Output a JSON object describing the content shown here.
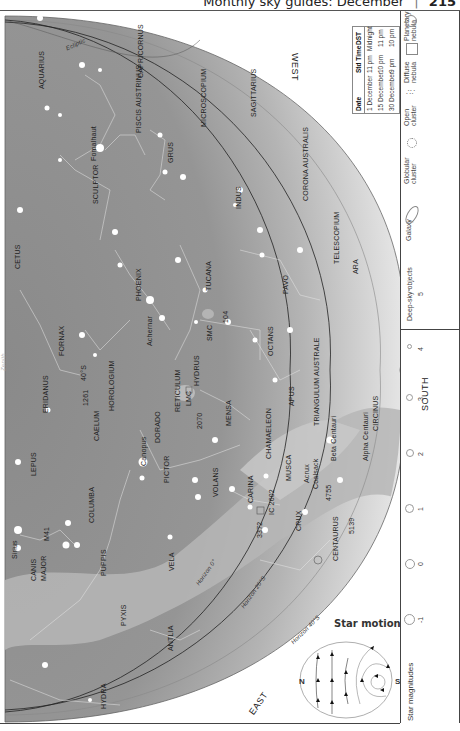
{
  "header": {
    "running_title": "Monthly sky guides: December",
    "separator": "|",
    "page_number": "215"
  },
  "chart": {
    "directions": {
      "west": "WEST",
      "south": "SOUTH",
      "east": "EAST"
    },
    "lines": {
      "ecliptic": "Ecliptic",
      "horizon_0": "Horizon 0°",
      "horizon_20": "Horizon 20°S",
      "horizon_40": "Horizon 40°S"
    },
    "faint_zenith": "Zenith",
    "constellations": [
      "AQUARIUS",
      "CAPRICORNUS",
      "PISCIS AUSTRINUS",
      "MICROSCOPIUM",
      "SAGITTARIUS",
      "SCULPTOR",
      "GRUS",
      "INDUS",
      "CORONA AUSTRALIS",
      "CETUS",
      "PHOENIX",
      "TUCANA",
      "TELESCOPIUM",
      "PAVO",
      "ARA",
      "FORNAX",
      "ERIDANUS",
      "HOROLOGIUM",
      "CAELUM",
      "RETICULUM",
      "HYDRUS",
      "OCTANS",
      "DORADO",
      "MENSA",
      "APUS",
      "TRIANGULUM AUSTRALE",
      "LEPUS",
      "PICTOR",
      "CHAMAELEON",
      "CIRCINUS",
      "COLUMBA",
      "VOLANS",
      "MUSCA",
      "CANIS MAJOR",
      "PUPPIS",
      "CARINA",
      "CRUX",
      "CENTAURUS",
      "VELA",
      "PYXIS",
      "ANTLIA",
      "HYDRA"
    ],
    "stars": {
      "fomalhaut": "Fomalhaut",
      "achernar": "Achernar",
      "canopus": "Canopus",
      "sirius": "Sirius",
      "acrux": "Acrux",
      "beta_cen": "Beta Centauri",
      "alpha_cen": "Alpha Centauri"
    },
    "objects": {
      "smc": "SMC",
      "lmc": "LMC",
      "ngc104": "104",
      "ngc2070": "2070",
      "ngc3372": "3372",
      "ic2602": "IC 2602",
      "ngc4755": "4755",
      "ngc5139": "5139",
      "m41": "M41",
      "ngc1261_label": "1261",
      "coalsack": "Coalsack",
      "eps_lbl": "40°S"
    }
  },
  "time_table": {
    "headers": [
      "Date",
      "Std Time",
      "DST"
    ],
    "rows": [
      [
        "1 December",
        "11 pm",
        "Midnight"
      ],
      [
        "15 December",
        "10 pm",
        "11 pm"
      ],
      [
        "30 December",
        "9 pm",
        "10 pm"
      ]
    ]
  },
  "legend": {
    "star_magnitudes_label": "Star magnitudes",
    "magnitudes": [
      "-1",
      "0",
      "1",
      "2",
      "3",
      "4",
      "5"
    ],
    "deep_sky_label": "Deep-sky objects",
    "deep_sky": [
      {
        "name": "Galaxy",
        "icon": "galaxy-ellipse"
      },
      {
        "name": "Globular cluster",
        "icon": "globular-cluster"
      },
      {
        "name": "Open cluster",
        "icon": "open-cluster"
      },
      {
        "name": "Diffuse nebula",
        "icon": "diffuse-nebula"
      },
      {
        "name": "Planetary nebula",
        "icon": "planetary-nebula"
      }
    ]
  },
  "star_motion": {
    "title": "Star motion",
    "north": "N",
    "south": "S"
  },
  "colors": {
    "sky_dark": "#8c8c8c",
    "sky_mid": "#a8a8a8",
    "sky_light": "#d9d9d9",
    "milky_way": "#bdbdbd",
    "line": "#333333"
  }
}
